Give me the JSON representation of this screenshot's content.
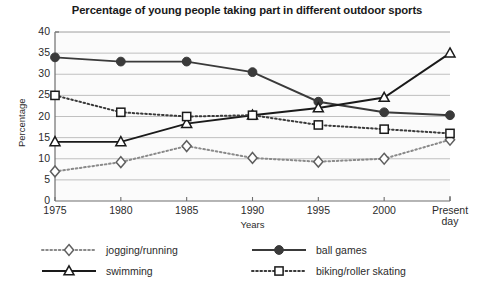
{
  "chart_data": {
    "type": "line",
    "title": "Percentage of young people taking part in different outdoor sports",
    "xlabel": "Years",
    "ylabel": "Percentage",
    "categories": [
      "1975",
      "1980",
      "1985",
      "1990",
      "1995",
      "2000",
      "Present day"
    ],
    "ylim": [
      0,
      40
    ],
    "yticks": [
      "0",
      "5",
      "10",
      "15",
      "20",
      "25",
      "30",
      "35",
      "40"
    ],
    "grid": true,
    "legend_position": "bottom",
    "series": [
      {
        "name": "jogging/running",
        "marker": "open-diamond",
        "line": "dotted",
        "color": "#8a8a8a",
        "values": [
          7,
          9.2,
          13,
          10.2,
          9.3,
          10,
          14.5
        ]
      },
      {
        "name": "ball games",
        "marker": "filled-circle",
        "line": "solid",
        "color": "#3a3a3a",
        "values": [
          34,
          33,
          33,
          30.5,
          23.5,
          21,
          20.3
        ]
      },
      {
        "name": "swimming",
        "marker": "open-triangle",
        "line": "solid",
        "color": "#1a1a1a",
        "values": [
          14,
          14,
          18.3,
          20.3,
          22,
          24.5,
          35
        ]
      },
      {
        "name": "biking/roller skating",
        "marker": "open-square",
        "line": "dotted",
        "color": "#3a3a3a",
        "values": [
          25,
          21,
          20,
          20.3,
          18,
          17,
          16
        ]
      }
    ]
  },
  "legend": {
    "items": [
      {
        "label": "jogging/running"
      },
      {
        "label": "ball games"
      },
      {
        "label": "swimming"
      },
      {
        "label": "biking/roller skating"
      }
    ]
  }
}
